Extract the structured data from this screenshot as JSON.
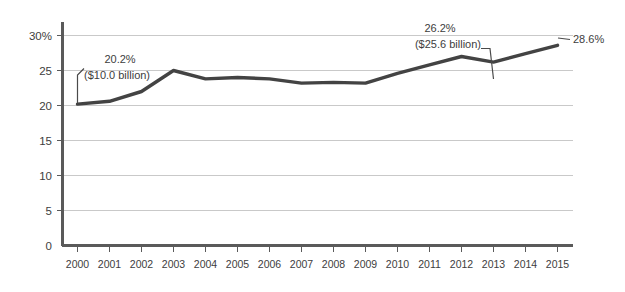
{
  "chart_data": {
    "type": "line",
    "title": "",
    "subtitle": "",
    "xlabel": "",
    "ylabel": "",
    "categories": [
      "2000",
      "2001",
      "2002",
      "2003",
      "2004",
      "2005",
      "2006",
      "2007",
      "2008",
      "2009",
      "2010",
      "2011",
      "2012",
      "2013",
      "2014",
      "2015"
    ],
    "series": [
      {
        "name": "Share",
        "values": [
          20.2,
          20.6,
          22.0,
          25.0,
          23.8,
          24.0,
          23.8,
          23.2,
          23.3,
          23.2,
          24.6,
          25.8,
          27.0,
          26.2,
          27.4,
          28.6
        ]
      }
    ],
    "ylim": [
      0,
      30
    ],
    "ytick_values": [
      0,
      5,
      10,
      15,
      20,
      25,
      30
    ],
    "ytick_labels": [
      "0",
      "5",
      "10",
      "15",
      "20",
      "25",
      "30%"
    ],
    "xtick_labels": [
      "2000",
      "2001",
      "2002",
      "2003",
      "2004",
      "2005",
      "2006",
      "2007",
      "2008",
      "2009",
      "2010",
      "2011",
      "2012",
      "2013",
      "2014",
      "2015"
    ],
    "grid": true,
    "grid_axis": "y",
    "legend": false,
    "legend_position": "none",
    "line_color": "#434343",
    "grid_color": "#c9c9c9",
    "axis_color": "#5a5a5a",
    "annotations": [
      {
        "id": "annot-2000",
        "target_category": "2000",
        "target_value": 20.2,
        "line1": "20.2%",
        "line2": "($10.0 billion)"
      },
      {
        "id": "annot-2013",
        "target_category": "2013",
        "target_value": 26.2,
        "line1": "26.2%",
        "line2": "($25.6 billion)"
      },
      {
        "id": "annot-2015",
        "target_category": "2015",
        "target_value": 28.6,
        "line1": "28.6%",
        "line2": ""
      }
    ]
  },
  "yticks": {
    "t0": "0",
    "t5": "5",
    "t10": "10",
    "t15": "15",
    "t20": "20",
    "t25": "25",
    "t30": "30%"
  },
  "xticks": {
    "x0": "2000",
    "x1": "2001",
    "x2": "2002",
    "x3": "2003",
    "x4": "2004",
    "x5": "2005",
    "x6": "2006",
    "x7": "2007",
    "x8": "2008",
    "x9": "2009",
    "x10": "2010",
    "x11": "2011",
    "x12": "2012",
    "x13": "2013",
    "x14": "2014",
    "x15": "2015"
  },
  "annotations": {
    "first": {
      "pct": "20.2%",
      "amount": "($10.0 billion)"
    },
    "dip": {
      "pct": "26.2%",
      "amount": "($25.6 billion)"
    },
    "last": {
      "pct": "28.6%"
    }
  }
}
